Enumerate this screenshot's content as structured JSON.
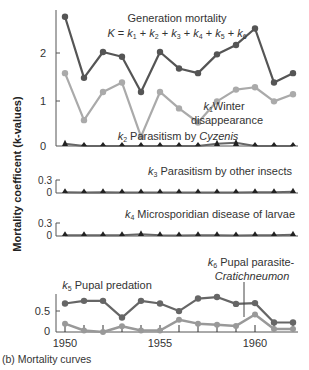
{
  "chart_data": [
    {
      "type": "line",
      "panel": "generation_mortality",
      "x": [
        1950,
        1951,
        1952,
        1953,
        1954,
        1955,
        1956,
        1957,
        1958,
        1959,
        1960,
        1961,
        1962
      ],
      "series": [
        {
          "name": "K (Generation mortality)",
          "color": "#555555",
          "values": [
            2.75,
            1.45,
            2.0,
            1.9,
            1.15,
            2.0,
            1.65,
            1.55,
            1.95,
            2.15,
            2.5,
            1.35,
            1.55
          ]
        },
        {
          "name": "k1 Winter disappearance",
          "color": "#aaaaaa",
          "values": [
            1.55,
            0.55,
            1.15,
            1.35,
            0.2,
            1.15,
            0.8,
            0.5,
            0.95,
            1.2,
            1.25,
            0.95,
            1.1
          ]
        },
        {
          "name": "k2 Parasitism by Cyzenis",
          "color": "#333333",
          "values": [
            0.05,
            0,
            0,
            0,
            0,
            0,
            0,
            0,
            0.05,
            0.07,
            0,
            0,
            0
          ]
        }
      ],
      "yticks": [
        0,
        1,
        2
      ],
      "ylim": [
        0,
        2.8
      ]
    },
    {
      "type": "line",
      "panel": "k3",
      "x": [
        1950,
        1951,
        1952,
        1953,
        1954,
        1955,
        1956,
        1957,
        1958,
        1959,
        1960,
        1961,
        1962
      ],
      "series": [
        {
          "name": "k3 Parasitism by other insects",
          "color": "#555555",
          "values": [
            0.02,
            0.01,
            0.02,
            0.01,
            0.01,
            0.01,
            0.01,
            0.01,
            0.01,
            0.01,
            0.02,
            0.02,
            0.03
          ]
        }
      ],
      "yticks": [
        0,
        0.3
      ],
      "ylim": [
        0,
        0.3
      ]
    },
    {
      "type": "line",
      "panel": "k4",
      "x": [
        1950,
        1951,
        1952,
        1953,
        1954,
        1955,
        1956,
        1957,
        1958,
        1959,
        1960,
        1961,
        1962
      ],
      "series": [
        {
          "name": "k4 Microsporidian disease of larvae",
          "color": "#333333",
          "values": [
            0.02,
            0.02,
            0.02,
            0.02,
            0.04,
            0.02,
            0.01,
            0.02,
            0.02,
            0.01,
            0.02,
            0.02,
            0.03
          ]
        }
      ],
      "yticks": [
        0,
        0.3
      ],
      "ylim": [
        0,
        0.3
      ]
    },
    {
      "type": "line",
      "panel": "k5_k6",
      "x": [
        1950,
        1951,
        1952,
        1953,
        1954,
        1955,
        1956,
        1957,
        1958,
        1959,
        1960,
        1961,
        1962
      ],
      "series": [
        {
          "name": "k5 Pupal predation",
          "color": "#666666",
          "values": [
            0.75,
            0.82,
            0.82,
            0.38,
            0.82,
            0.75,
            0.55,
            0.88,
            0.92,
            0.74,
            0.76,
            0.25,
            0.25
          ]
        },
        {
          "name": "k6 Pupal parasite-Cratichneumon",
          "color": "#999999",
          "values": [
            0.22,
            0.04,
            0.0,
            0.15,
            0.04,
            0.04,
            0.32,
            0.22,
            0.19,
            0.16,
            0.46,
            0.08,
            0.08
          ]
        }
      ],
      "yticks": [
        0,
        0.5
      ],
      "ylim": [
        0,
        0.9
      ],
      "xticks": [
        1950,
        1955,
        1960
      ]
    }
  ],
  "labels": {
    "ylabel": "Mortality coefficent (k-values)",
    "caption": "(b) Mortality curves",
    "k_title": "Generation mortality",
    "k_formula": "K = k1 + k2 + k3 + k4 + k5 + k6",
    "k1_line1": "Winter",
    "k1_line2": "disappearance",
    "k2_text": "Parasitism by ",
    "k2_italic": "Cyzenis",
    "k3_text": "Parasitism by other insects",
    "k4_text": "Microsporidian disease of larvae",
    "k5_text": "Pupal predation",
    "k6_line1": "Pupal parasite-",
    "k6_line2": "Cratichneumon",
    "top_yticks": [
      "0",
      "1",
      "2"
    ],
    "small_yticks": [
      "0.3",
      "0"
    ],
    "bottom_yticks": [
      "0.5",
      "0"
    ],
    "xticks": [
      "1950",
      "1955",
      "1960"
    ]
  }
}
